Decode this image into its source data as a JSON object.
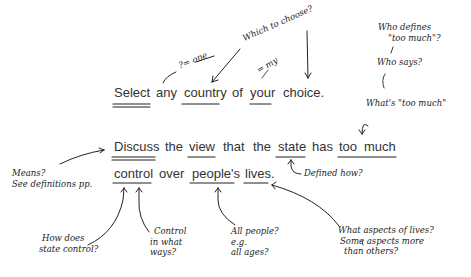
{
  "question": {
    "line1": [
      "Select",
      "any",
      "country",
      "of",
      "your",
      "choice."
    ],
    "line2": [
      "Discuss",
      "the",
      "view",
      "that",
      "the",
      "state",
      "has",
      "too",
      "much"
    ],
    "line3": [
      "control",
      "over",
      "people's",
      "lives."
    ]
  },
  "annotations": {
    "one": "?= one",
    "which": "Which to choose?",
    "my": "= my",
    "who_defines_1": "Who defines",
    "who_defines_2": "\"too much\"?",
    "who_says": "Who says?",
    "whats_too_much": "What's \"too much\"",
    "means_1": "Means?",
    "means_2": "See definitions pp.",
    "defined_how": "Defined how?",
    "how_does_1": "How does",
    "how_does_2": "state control?",
    "control_1": "Control",
    "control_2": "in what",
    "control_3": "ways?",
    "all_people_1": "All people?",
    "all_people_2": "e.g.",
    "all_people_3": "all ages?",
    "aspects_1": "What aspects of lives?",
    "aspects_2": "Some aspects more",
    "aspects_3": "than others?"
  }
}
